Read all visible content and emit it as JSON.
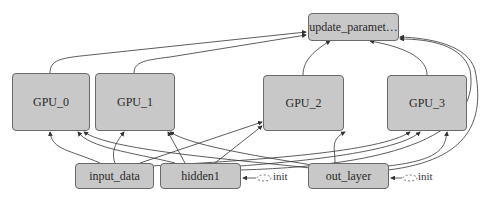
{
  "graph": {
    "nodes": {
      "update": {
        "label": "update_paramet…"
      },
      "gpu0": {
        "label": "GPU_0"
      },
      "gpu1": {
        "label": "GPU_1"
      },
      "gpu2": {
        "label": "GPU_2"
      },
      "gpu3": {
        "label": "GPU_3"
      },
      "input_data": {
        "label": "input_data"
      },
      "hidden1": {
        "label": "hidden1"
      },
      "out_layer": {
        "label": "out_layer"
      }
    },
    "init_labels": [
      "init",
      "init"
    ],
    "colors": {
      "node_fill": "#c8c8c8",
      "node_border": "#6a6a6a",
      "edge": "#333333",
      "background": "#ffffff"
    },
    "edges": [
      {
        "from": "gpu0",
        "to": "update"
      },
      {
        "from": "gpu1",
        "to": "update"
      },
      {
        "from": "gpu2",
        "to": "update"
      },
      {
        "from": "gpu3",
        "to": "update"
      },
      {
        "from": "input_data",
        "to": "gpu0"
      },
      {
        "from": "input_data",
        "to": "gpu1"
      },
      {
        "from": "input_data",
        "to": "gpu2"
      },
      {
        "from": "input_data",
        "to": "gpu3"
      },
      {
        "from": "hidden1",
        "to": "gpu0"
      },
      {
        "from": "hidden1",
        "to": "gpu1"
      },
      {
        "from": "hidden1",
        "to": "gpu2"
      },
      {
        "from": "hidden1",
        "to": "gpu3"
      },
      {
        "from": "hidden1",
        "to": "update"
      },
      {
        "from": "out_layer",
        "to": "gpu0"
      },
      {
        "from": "out_layer",
        "to": "gpu1"
      },
      {
        "from": "out_layer",
        "to": "gpu2"
      },
      {
        "from": "out_layer",
        "to": "gpu3"
      },
      {
        "from": "out_layer",
        "to": "update"
      },
      {
        "from": "init",
        "to": "hidden1",
        "style": "dashed"
      },
      {
        "from": "init",
        "to": "out_layer",
        "style": "dashed"
      }
    ]
  }
}
